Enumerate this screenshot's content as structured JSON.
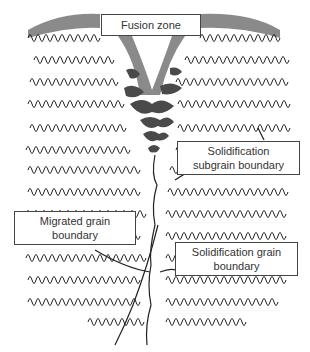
{
  "diagram": {
    "colors": {
      "background": "#ffffff",
      "grain_lines": "#222222",
      "fusion_zone_light": "#8a8a8a",
      "fusion_zone_dark": "#4a4a4a",
      "label_border": "#444444"
    },
    "labels": [
      {
        "id": "fusion-zone",
        "lines": [
          "Fusion zone"
        ]
      },
      {
        "id": "subgrain",
        "lines": [
          "Solidification",
          "subgrain boundary"
        ]
      },
      {
        "id": "migrated",
        "lines": [
          "Migrated grain",
          "boundary"
        ]
      },
      {
        "id": "solid-grain",
        "lines": [
          "Solidification grain",
          "boundary"
        ]
      }
    ]
  }
}
